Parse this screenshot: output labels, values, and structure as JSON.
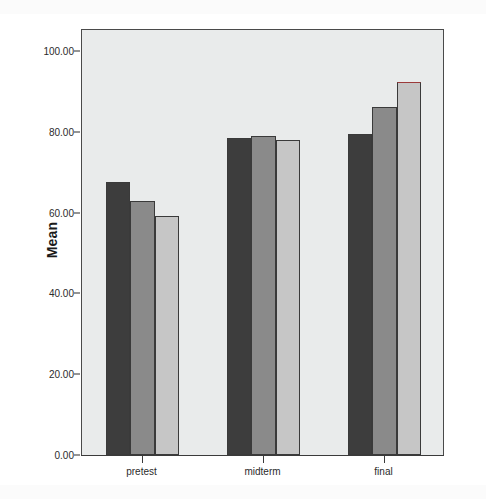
{
  "chart_data": {
    "type": "bar",
    "title": "",
    "subtitle": "",
    "xlabel": "",
    "ylabel": "Mean",
    "categories": [
      "pretest",
      "midterm",
      "final"
    ],
    "series": [
      {
        "name": "series-1",
        "color": "#3d3d3d",
        "values": [
          67.6,
          78.6,
          79.4
        ]
      },
      {
        "name": "series-2",
        "color": "#8a8a8a",
        "values": [
          62.9,
          79.1,
          86.3
        ]
      },
      {
        "name": "series-3",
        "color": "#c6c6c6",
        "values": [
          59.2,
          78.0,
          92.4
        ]
      }
    ],
    "ylim": [
      0,
      105.5
    ],
    "yticks": [
      0,
      20,
      40,
      60,
      80,
      100
    ],
    "ytick_labels": [
      "0.00",
      "20.00",
      "40.00",
      "60.00",
      "80.00",
      "100.00"
    ],
    "grid": false,
    "legend": "none",
    "plot_background": "#e9ebeb",
    "frame_color": "#4a4a4a",
    "bar_outline_color": "#3a3a3a",
    "highlight_edge_color": "#9c3a3a",
    "highlighted_bar": {
      "category": "final",
      "series": "series-3"
    },
    "annotations": []
  }
}
